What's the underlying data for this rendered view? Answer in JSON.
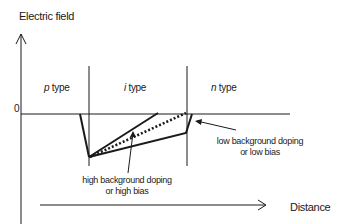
{
  "diagram": {
    "y_axis_label": "Electric field",
    "x_axis_label": "Distance",
    "zero_label": "0",
    "regions": [
      {
        "prefix": "p",
        "suffix": " type"
      },
      {
        "prefix": "i",
        "suffix": " type"
      },
      {
        "prefix": "n",
        "suffix": " type"
      }
    ],
    "annotations": {
      "high": {
        "line1": "high background doping",
        "line2": "or high bias"
      },
      "low": {
        "line1": "low background doping",
        "line2": "or low bias"
      }
    },
    "colors": {
      "line": "#1a1a1a",
      "background": "#ffffff"
    }
  }
}
